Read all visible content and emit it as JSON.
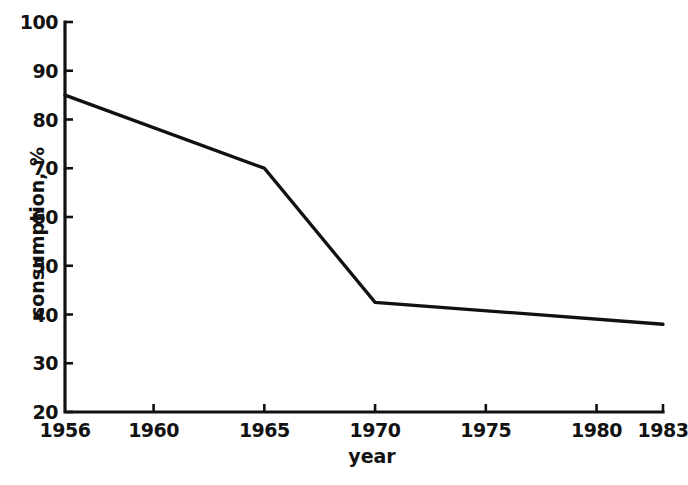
{
  "chart_data": {
    "type": "line",
    "title": "",
    "xlabel": "year",
    "ylabel": "consumption, %",
    "xlim": [
      1956,
      1983
    ],
    "ylim": [
      20,
      100
    ],
    "grid": false,
    "legend": null,
    "line_color": "#111111",
    "background_color": "#ffffff",
    "xticks": [
      1956,
      1960,
      1965,
      1970,
      1975,
      1980,
      1983
    ],
    "xtick_labels": [
      "1956",
      "1960",
      "1965",
      "1970",
      "1975",
      "1980",
      "1983"
    ],
    "yticks": [
      20,
      30,
      40,
      50,
      60,
      70,
      80,
      90,
      100
    ],
    "ytick_labels": [
      "20",
      "30",
      "40",
      "50",
      "60",
      "70",
      "80",
      "90",
      "100"
    ],
    "series": [
      {
        "name": "consumption",
        "x": [
          1956,
          1965,
          1970,
          1983
        ],
        "values": [
          85,
          70,
          42.5,
          38
        ]
      }
    ]
  }
}
